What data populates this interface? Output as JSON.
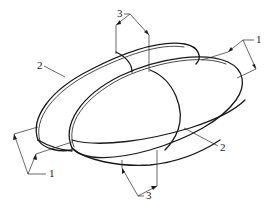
{
  "figure": {
    "stroke_color": "#1a1a1a",
    "background": "#ffffff"
  },
  "callouts": [
    {
      "id": "callout-3-top",
      "label": "3",
      "x": 119,
      "y": 12
    },
    {
      "id": "callout-1-right",
      "label": "1",
      "x": 256,
      "y": 37
    },
    {
      "id": "callout-2-left",
      "label": "2",
      "x": 38,
      "y": 62
    },
    {
      "id": "callout-2-right",
      "label": "2",
      "x": 220,
      "y": 144
    },
    {
      "id": "callout-1-left",
      "label": "1",
      "x": 49,
      "y": 170
    },
    {
      "id": "callout-3-bottom",
      "label": "3",
      "x": 146,
      "y": 192
    }
  ]
}
